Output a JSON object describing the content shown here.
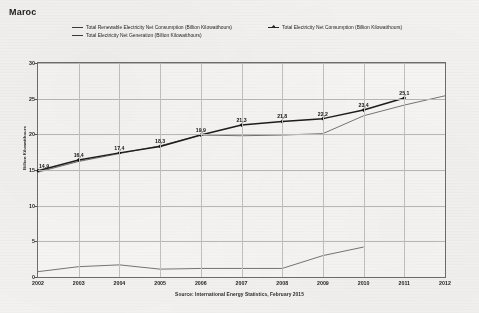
{
  "title": "Maroc",
  "source": "Source: International Energy Statistics, February 2015",
  "legend": {
    "items": [
      {
        "label": "Total Renewable Electricity Net Consumption (Billion Kilowatthours)",
        "marker": "line",
        "color": "#3a3a3a"
      },
      {
        "label": "Total Electricity Net Consumption (Billion Kilowatthours)",
        "marker": "line-diamond",
        "color": "#262626"
      },
      {
        "label": "Total Electricity Net Generation (Billion Kilowatthours)",
        "marker": "line",
        "color": "#3a3a3a"
      }
    ]
  },
  "chart_data": {
    "type": "line",
    "title": "Maroc",
    "xlabel": "",
    "ylabel": "Billion Kilowatthours",
    "x": [
      2002,
      2003,
      2004,
      2005,
      2006,
      2007,
      2008,
      2009,
      2010,
      2011,
      2012
    ],
    "xlim": [
      2002,
      2012
    ],
    "ylim": [
      0,
      30
    ],
    "yticks": [
      0,
      5,
      10,
      15,
      20,
      25,
      30
    ],
    "xticks": [
      "2002",
      "2003",
      "2004",
      "2005",
      "2006",
      "2007",
      "2008",
      "2009",
      "2010",
      "2011",
      "2012"
    ],
    "grid": true,
    "legend_position": "top",
    "series": [
      {
        "name": "Total Electricity Net Consumption (Billion Kilowatthours)",
        "values": [
          14.9,
          16.4,
          17.4,
          18.3,
          19.9,
          21.3,
          21.8,
          22.2,
          23.4,
          25.1,
          null
        ],
        "labels": [
          "14,9",
          "16,4",
          "17,4",
          "18,3",
          "19,9",
          "21,3",
          "21,8",
          "22,2",
          "23,4",
          "25,1"
        ],
        "style": "thick-diamond-markers"
      },
      {
        "name": "Total Electricity Net Generation (Billion Kilowatthours)",
        "values": [
          14.7,
          16.2,
          17.3,
          18.4,
          19.9,
          19.8,
          19.9,
          20.1,
          22.6,
          24.1,
          25.4
        ],
        "style": "thin"
      },
      {
        "name": "Total Renewable Electricity Net Consumption (Billion Kilowatthours)",
        "values": [
          0.75,
          1.45,
          1.7,
          1.1,
          1.2,
          1.2,
          1.2,
          3.0,
          4.2,
          null,
          null
        ],
        "style": "thin"
      }
    ]
  }
}
